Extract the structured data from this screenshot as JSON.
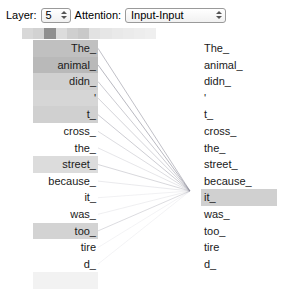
{
  "toolbar": {
    "layer_label": "Layer:",
    "layer_value": "5",
    "attention_label": "Attention:",
    "attention_value": "Input-Input"
  },
  "visualization": {
    "focus_token": "it_",
    "focus_index": 8,
    "line_color": "#8c8c99",
    "highlight_color": "#c9c9c9"
  },
  "top_strip": {
    "left": 22,
    "cell_width": 11.2,
    "shades": [
      "#d8d8d8",
      "#d2d2d2",
      "#8f8f8f",
      "#dcdcdc",
      "#cfcfcf",
      "#c9c9c9",
      "#e2e2e2",
      "#e6e6e6",
      "#e9e9e9",
      "#ebebeb",
      "#ededed",
      "#efefef"
    ]
  },
  "left_column": {
    "tokens": [
      "The_",
      "animal_",
      "didn_",
      "'",
      "t_",
      "cross_",
      "the_",
      "street_",
      "because_",
      "it_",
      "was_",
      "too_",
      "tire",
      "d_",
      ""
    ],
    "weights": [
      0.4,
      0.44,
      0.3,
      0.26,
      0.3,
      0.0,
      0.0,
      0.22,
      0.0,
      0.0,
      0.0,
      0.28,
      0.0,
      0.0,
      0.08
    ]
  },
  "right_column": {
    "tokens": [
      "The_",
      "animal_",
      "didn_",
      "'",
      "t_",
      "cross_",
      "the_",
      "street_",
      "because_",
      "it_",
      "was_",
      "too_",
      "tire",
      "d_"
    ],
    "weights": [
      0,
      0,
      0,
      0,
      0,
      0,
      0,
      0,
      0,
      0.3,
      0,
      0,
      0,
      0
    ]
  },
  "attention_lines": {
    "source_x": 98,
    "target_x": 190,
    "target_y": 191,
    "edges": [
      {
        "from": 0,
        "opacity": 0.55
      },
      {
        "from": 1,
        "opacity": 0.62
      },
      {
        "from": 2,
        "opacity": 0.45
      },
      {
        "from": 3,
        "opacity": 0.38
      },
      {
        "from": 4,
        "opacity": 0.44
      },
      {
        "from": 5,
        "opacity": 0.3
      },
      {
        "from": 6,
        "opacity": 0.22
      },
      {
        "from": 7,
        "opacity": 0.34
      },
      {
        "from": 8,
        "opacity": 0.18
      },
      {
        "from": 9,
        "opacity": 0.12
      },
      {
        "from": 10,
        "opacity": 0.14
      },
      {
        "from": 11,
        "opacity": 0.3
      },
      {
        "from": 12,
        "opacity": 0.1
      },
      {
        "from": 13,
        "opacity": 0.1
      }
    ]
  }
}
